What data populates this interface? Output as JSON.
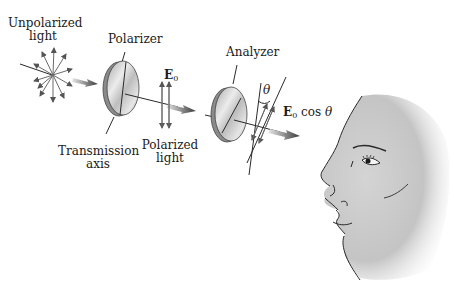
{
  "labels": {
    "unpolarized_line1": "Unpolarized",
    "unpolarized_line2": "light",
    "polarizer": "Polarizer",
    "transmission_line1": "Transmission",
    "transmission_line2": "axis",
    "e0_symbol": "E",
    "e0_sub": "0",
    "polarized_line1": "Polarized",
    "polarized_line2": "light",
    "analyzer": "Analyzer",
    "theta": "θ",
    "e0cos_symbol": "E",
    "e0cos_sub": "0",
    "e0cos_text": " cos ",
    "e0cos_theta": "θ"
  },
  "colors": {
    "line": "#2a2a2a",
    "arrow_gray": "#6e6e6e",
    "disk_edge": "#7a7a7a",
    "disk_face": "#cfcfcf",
    "face_skin": "#c8c8c8"
  }
}
